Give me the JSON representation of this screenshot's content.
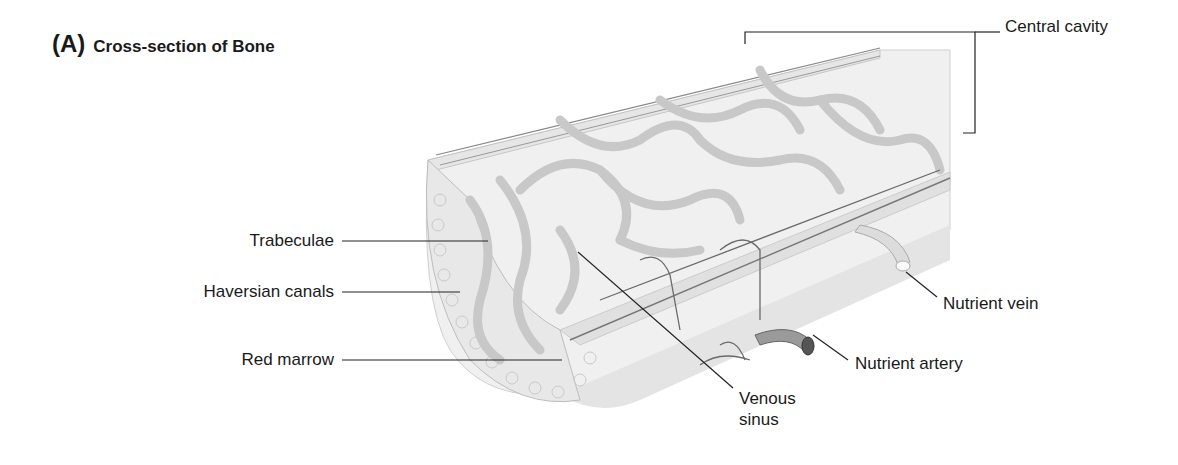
{
  "figure": {
    "panel": "(A)",
    "title": "Cross-section of Bone"
  },
  "labels": {
    "central_cavity": "Central cavity",
    "trabeculae": "Trabeculae",
    "haversian_canals": "Haversian canals",
    "red_marrow": "Red marrow",
    "venous_sinus_line1": "Venous",
    "venous_sinus_line2": "sinus",
    "nutrient_artery": "Nutrient artery",
    "nutrient_vein": "Nutrient vein"
  },
  "colors": {
    "bone_fill": "#ececec",
    "trabecula": "#c8c8c8",
    "outer_shell": "#e2e2e2",
    "vessel": "#6a6a6a",
    "leader_line": "#222222"
  }
}
